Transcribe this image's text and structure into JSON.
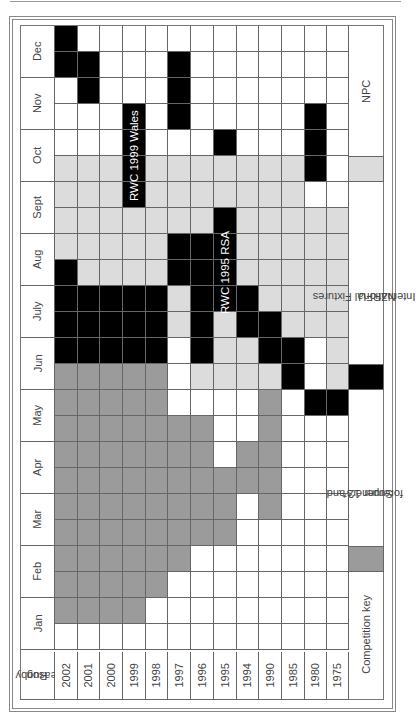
{
  "chart_data": {
    "type": "heatmap",
    "title": "",
    "orientation": "rotated 90 degrees counter-clockwise",
    "row_header": "Rugby season",
    "years": [
      "2002",
      "2001",
      "2000",
      "1999",
      "1998",
      "1997",
      "1996",
      "1995",
      "1994",
      "1990",
      "1985",
      "1980",
      "1975"
    ],
    "months": [
      "Dec",
      "Nov",
      "Oct",
      "Sept",
      "Aug",
      "July",
      "Jun",
      "May",
      "Apr",
      "Mar",
      "Feb",
      "Jan"
    ],
    "half_month_rows_top_to_bottom": [
      "Dec-2",
      "Dec-1",
      "Nov-2",
      "Nov-1",
      "Oct-2",
      "Oct-1",
      "Sept-2",
      "Sept-1",
      "Aug-2",
      "Aug-1",
      "July-2",
      "July-1",
      "Jun-2",
      "Jun-1",
      "May-2",
      "May-1",
      "Apr-2",
      "Apr-1",
      "Mar-2",
      "Mar-1",
      "Feb-2",
      "Feb-1",
      "Jan-2",
      "Jan-1"
    ],
    "legend": {
      "w": "No competition",
      "l": "NPC",
      "b": "International Fixtures NZRFU",
      "d": "Super 12 and forerunners*"
    },
    "grid": [
      "bwwwwwwwwwwww",
      "bbwwwbwwwwwww",
      "wbwwwbwwwwwww",
      "wwwbwbwwwwwbw",
      "wwwbwwwbwwwbw",
      "lllblllllllbw",
      "lllblllllllww",
      "lllllllblllll",
      "lllllbbblllll",
      "bllllbbblllll",
      "bbbbblbbbllll",
      "bbbbblblbblll",
      "bbbbbwbllbbwl",
      "dddddwllllbwl",
      "dddddwwwwdwbb",
      "dddddddwwdwww",
      "dddddddwddwww",
      "ddddddddddwww",
      "ddddddddwdwww",
      "ddddddddwwwww",
      "ddddddwwwwwww",
      "dddddwwwwwwww",
      "ddddwwwwwwwww",
      "wwwwwwwwwwwww"
    ],
    "annotations": [
      {
        "text": "RWC 1999 Wales",
        "year": "1999",
        "from_row": 3,
        "to_row": 6
      },
      {
        "text": "RWC 1995 RSA",
        "year": "1995",
        "from_row": 7,
        "to_row": 11
      }
    ],
    "colors": {
      "w": "#ffffff",
      "l": "#dcdcdc",
      "d": "#9b9b9b",
      "b": "#000000"
    }
  },
  "key": {
    "title": "Competition key",
    "items": [
      {
        "label": "NPC",
        "swatch": "l",
        "row": 5
      },
      {
        "label": "International Fixtures NZRFU",
        "line1": "International Fixtures",
        "line2": "NZRFU",
        "swatch": "b",
        "row": 13
      },
      {
        "label": "Super 12 and forerunners*",
        "line1": "Super 12 and",
        "line2": "forerunners*",
        "swatch": "d",
        "row": 20
      }
    ]
  },
  "header": {
    "rugby_season_line1": "Rugby",
    "rugby_season_line2": "season"
  }
}
